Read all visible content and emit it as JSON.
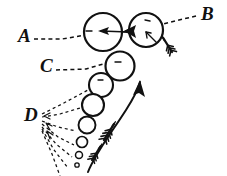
{
  "figure": {
    "title": "Hand-drawn schematic of bubble chain with labelled callouts",
    "background_color": "#ffffff",
    "ink_color": "#111111",
    "width": 227,
    "height": 176
  },
  "labels": [
    {
      "id": "A",
      "text": "A",
      "x": 18,
      "y": 42,
      "leader": "dashed-horizontal-right"
    },
    {
      "id": "B",
      "text": "B",
      "x": 203,
      "y": 20,
      "leader": "dashed-diagonal-left-down"
    },
    {
      "id": "C",
      "text": "C",
      "x": 40,
      "y": 72,
      "leader": "dashed-diagonal-right-up"
    },
    {
      "id": "D",
      "text": "D",
      "x": 25,
      "y": 120,
      "leader": "dashed-fan-right"
    }
  ],
  "bubbles": [
    {
      "name": "bubble-a",
      "cx": 103,
      "cy": 32,
      "r": 19,
      "stroke_width": 2.2
    },
    {
      "name": "bubble-b",
      "cx": 146,
      "cy": 30,
      "r": 17,
      "stroke_width": 2.2
    },
    {
      "name": "bubble-c",
      "cx": 120,
      "cy": 66,
      "r": 14.5,
      "stroke_width": 2.2
    },
    {
      "name": "bubble-d1",
      "cx": 101,
      "cy": 85,
      "r": 12,
      "stroke_width": 2.1
    },
    {
      "name": "bubble-d2",
      "cx": 93,
      "cy": 105,
      "r": 11,
      "stroke_width": 2.1
    },
    {
      "name": "bubble-d3",
      "cx": 87,
      "cy": 125,
      "r": 8.5,
      "stroke_width": 1.9
    },
    {
      "name": "bubble-d4",
      "cx": 82,
      "cy": 142,
      "r": 5.5,
      "stroke_width": 1.7
    },
    {
      "name": "bubble-d5",
      "cx": 79,
      "cy": 155,
      "r": 3.5,
      "stroke_width": 1.5
    },
    {
      "name": "bubble-d6",
      "cx": 77,
      "cy": 165,
      "r": 2.2,
      "stroke_width": 1.3
    }
  ],
  "arrows": {
    "flow_arrow": {
      "name": "curved-flow-arrow",
      "description": "long curved solid arrow sweeping up-right toward the bubble chain",
      "head_direction": "up-right"
    },
    "horizontal_arrow": {
      "name": "horizontal-flow-arrow",
      "description": "solid straight arrow across bubble A and bubble B",
      "head_direction": "left"
    },
    "fletched": [
      {
        "name": "fletched-arrow-upper",
        "x": 166,
        "y": 48,
        "angle": -125
      },
      {
        "name": "fletched-arrow-lower",
        "x": 108,
        "y": 134,
        "angle": -60
      },
      {
        "name": "fletched-arrow-bottom",
        "x": 97,
        "y": 152,
        "angle": -60
      }
    ],
    "inner_ticks": [
      {
        "name": "bubble-b-inner-arrow-left",
        "target": "bubble-b"
      },
      {
        "name": "bubble-b-inner-arrow-lower",
        "target": "bubble-b"
      },
      {
        "name": "bubble-a-inner-arrow",
        "target": "bubble-a"
      }
    ]
  }
}
